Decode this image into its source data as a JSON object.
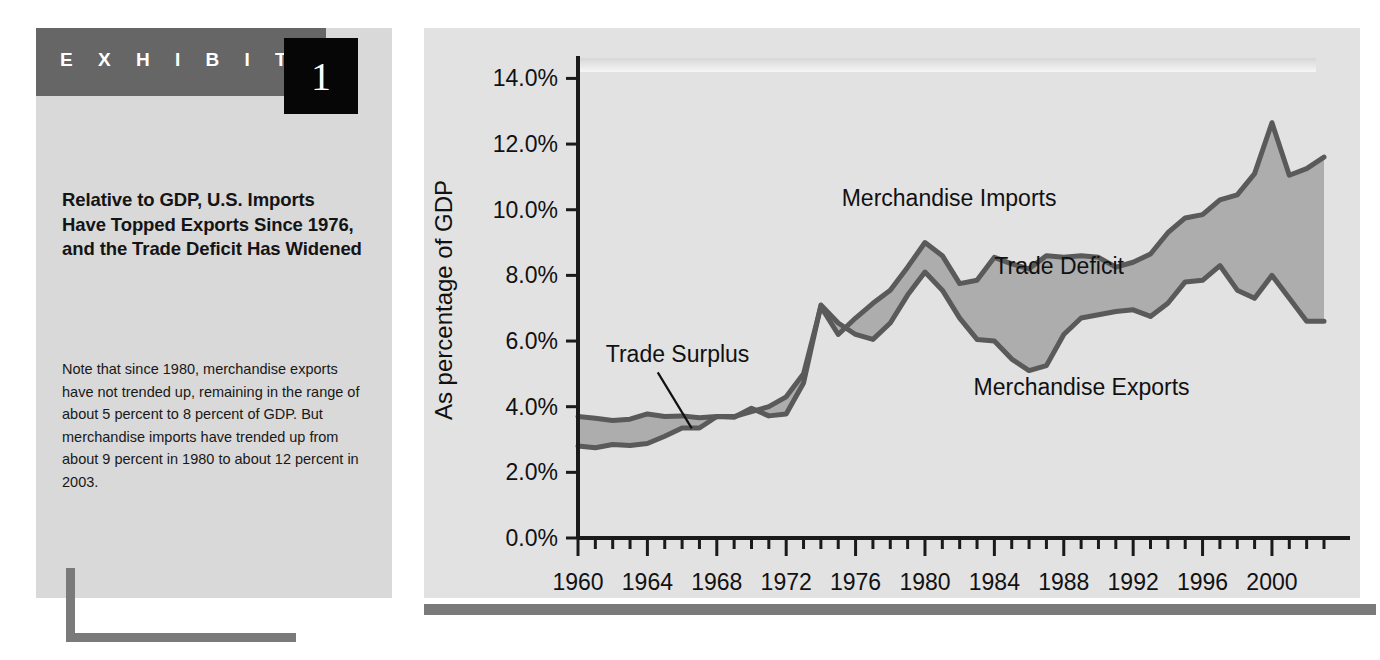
{
  "exhibit": {
    "label": "E X H I B I T",
    "number": "1",
    "headline": "Relative to GDP, U.S. Imports Have Topped Exports Since 1976, and the Trade Deficit Has Widened",
    "note": "Note that since 1980, merchandise exports have not trended up, remaining in the range of about 5 percent to 8 percent of GDP. But merchandise imports have trended up from about 9 percent in 1980 to about 12 percent in 2003."
  },
  "colors": {
    "band_gray": "#666666",
    "number_box": "#060606",
    "panel": "#d9d9d9",
    "chart_panel": "#e2e2e2",
    "line": "#5a5a5a",
    "fill": "#adadad",
    "rule": "#7a7a7a"
  },
  "chart_data": {
    "type": "area",
    "title": "",
    "xlabel": "",
    "ylabel": "As percentage of GDP",
    "xlim": [
      1960,
      2003
    ],
    "ylim": [
      0,
      14.5
    ],
    "ytick_values": [
      0,
      2,
      4,
      6,
      8,
      10,
      12,
      14
    ],
    "ytick_labels": [
      "0.0%",
      "2.0%",
      "4.0%",
      "6.0%",
      "8.0%",
      "10.0%",
      "12.0%",
      "14.0%"
    ],
    "xtick_labels": [
      "1960",
      "1964",
      "1968",
      "1972",
      "1976",
      "1980",
      "1984",
      "1988",
      "1992",
      "1996",
      "2000"
    ],
    "xtick_values": [
      1960,
      1964,
      1968,
      1972,
      1976,
      1980,
      1984,
      1988,
      1992,
      1996,
      2000
    ],
    "xtick_step_minor": 1,
    "grid": false,
    "legend": "annotations-inline",
    "annotations": [
      {
        "text": "Merchandise Imports",
        "x": 1975.2,
        "y": 10.1
      },
      {
        "text": "Trade Deficit",
        "x": 1984.0,
        "y": 8.05
      },
      {
        "text": "Merchandise Exports",
        "x": 1982.8,
        "y": 4.35
      },
      {
        "text": "Trade Surplus",
        "x": 1961.6,
        "y": 5.35,
        "leader": true
      }
    ],
    "x": [
      1960,
      1961,
      1962,
      1963,
      1964,
      1965,
      1966,
      1967,
      1968,
      1969,
      1970,
      1971,
      1972,
      1973,
      1974,
      1975,
      1976,
      1977,
      1978,
      1979,
      1980,
      1981,
      1982,
      1983,
      1984,
      1985,
      1986,
      1987,
      1988,
      1989,
      1990,
      1991,
      1992,
      1993,
      1994,
      1995,
      1996,
      1997,
      1998,
      1999,
      2000,
      2001,
      2002,
      2003
    ],
    "series": [
      {
        "name": "Merchandise Exports",
        "values": [
          3.7,
          3.65,
          3.58,
          3.62,
          3.78,
          3.7,
          3.72,
          3.66,
          3.7,
          3.68,
          3.95,
          3.72,
          3.78,
          4.72,
          7.1,
          6.55,
          6.2,
          6.05,
          6.55,
          7.4,
          8.1,
          7.55,
          6.7,
          6.05,
          6.0,
          5.45,
          5.1,
          5.25,
          6.2,
          6.7,
          6.8,
          6.9,
          6.95,
          6.75,
          7.15,
          7.8,
          7.85,
          8.3,
          7.55,
          7.3,
          8.0,
          7.3,
          6.6,
          6.6
        ]
      },
      {
        "name": "Merchandise Imports",
        "values": [
          2.8,
          2.75,
          2.85,
          2.82,
          2.88,
          3.1,
          3.35,
          3.35,
          3.7,
          3.7,
          3.85,
          4.0,
          4.3,
          5.0,
          7.05,
          6.2,
          6.7,
          7.15,
          7.55,
          8.25,
          9.0,
          8.6,
          7.75,
          7.85,
          8.55,
          8.35,
          8.2,
          8.6,
          8.55,
          8.6,
          8.55,
          8.25,
          8.4,
          8.65,
          9.3,
          9.75,
          9.85,
          10.3,
          10.45,
          11.1,
          12.65,
          11.05,
          11.25,
          11.6
        ]
      }
    ]
  }
}
